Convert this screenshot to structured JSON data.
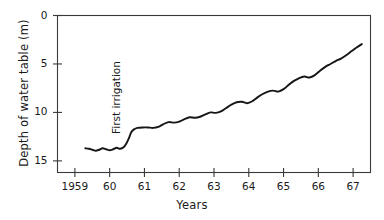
{
  "chart_data": {
    "type": "line",
    "title": "",
    "xlabel": "Years",
    "ylabel": "Depth of water table (m)",
    "xlim": [
      1958.5,
      1967.5
    ],
    "ylim": [
      16.2,
      0
    ],
    "y_inverted": true,
    "grid": false,
    "legend": null,
    "xticks": [
      1959,
      1960,
      1961,
      1962,
      1963,
      1964,
      1965,
      1966,
      1967
    ],
    "xtick_labels": [
      "1959",
      "60",
      "61",
      "62",
      "63",
      "64",
      "65",
      "66",
      "67"
    ],
    "yticks": [
      0,
      5,
      10,
      15
    ],
    "ytick_labels": [
      "0",
      "5",
      "10",
      "15"
    ],
    "annotations": [
      {
        "text": "First irrigation",
        "x": 1960.1,
        "y": 12.0,
        "rotation": 90
      }
    ],
    "series": [
      {
        "name": "Depth of water table",
        "color": "#161616",
        "x": [
          1959.3,
          1959.4,
          1959.5,
          1959.6,
          1959.7,
          1959.8,
          1959.9,
          1960.0,
          1960.1,
          1960.2,
          1960.3,
          1960.4,
          1960.48,
          1960.56,
          1960.62,
          1960.7,
          1960.8,
          1960.95,
          1961.1,
          1961.25,
          1961.4,
          1961.55,
          1961.7,
          1961.85,
          1962.0,
          1962.15,
          1962.3,
          1962.45,
          1962.6,
          1962.75,
          1962.9,
          1963.05,
          1963.2,
          1963.35,
          1963.5,
          1963.65,
          1963.8,
          1963.95,
          1964.1,
          1964.25,
          1964.4,
          1964.55,
          1964.7,
          1964.85,
          1965.0,
          1965.15,
          1965.3,
          1965.45,
          1965.6,
          1965.75,
          1965.9,
          1966.05,
          1966.2,
          1966.35,
          1966.5,
          1966.65,
          1966.8,
          1966.95,
          1967.1,
          1967.25
        ],
        "y": [
          13.7,
          13.75,
          13.85,
          13.95,
          13.85,
          13.7,
          13.8,
          13.9,
          13.8,
          13.65,
          13.75,
          13.6,
          13.2,
          12.6,
          12.05,
          11.75,
          11.6,
          11.55,
          11.55,
          11.6,
          11.5,
          11.2,
          11.0,
          11.05,
          10.95,
          10.7,
          10.5,
          10.55,
          10.45,
          10.2,
          10.0,
          10.05,
          9.9,
          9.55,
          9.2,
          8.95,
          8.9,
          9.05,
          8.85,
          8.45,
          8.1,
          7.85,
          7.75,
          7.85,
          7.6,
          7.15,
          6.75,
          6.45,
          6.3,
          6.4,
          6.15,
          5.7,
          5.3,
          5.0,
          4.7,
          4.45,
          4.1,
          3.7,
          3.3,
          2.95
        ]
      }
    ]
  },
  "axes": {
    "frame_color": "#3a3a3a"
  }
}
